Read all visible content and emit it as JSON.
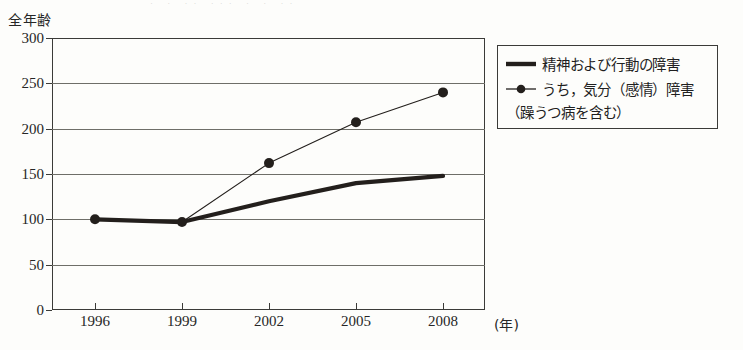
{
  "page": {
    "unit_label": "全年齢",
    "scan_remnant": "· ·  ·· ··· ·  ·  ··"
  },
  "chart_data": {
    "type": "line",
    "title": "",
    "subtitle": "",
    "unit_caption": "全年齢",
    "xlabel": "(年)",
    "ylabel": "",
    "categories": [
      "1996",
      "1999",
      "2002",
      "2005",
      "2008"
    ],
    "x": [
      1996,
      1999,
      2002,
      2005,
      2008
    ],
    "xtick_labels": [
      "1996",
      "1999",
      "2002",
      "2005",
      "2008"
    ],
    "ytick_labels": [
      "0",
      "50",
      "100",
      "150",
      "200",
      "250",
      "300"
    ],
    "yticks": [
      0,
      50,
      100,
      150,
      200,
      250,
      300
    ],
    "ylim": [
      0,
      300
    ],
    "xlim": [
      1995,
      2009.5
    ],
    "grid": true,
    "grid_axis": "y",
    "legend_position": "right-outside",
    "series": [
      {
        "name": "精神および行動の障害",
        "values": [
          100,
          97,
          120,
          140,
          148
        ],
        "style": "thick-line",
        "marker": "none",
        "color": "#231f1c",
        "line_width": 4.2
      },
      {
        "name": "うち，気分（感情）障害（躁うつ病を含む）",
        "name_line1": "うち，気分（感情）障害",
        "name_line2": "（躁うつ病を含む）",
        "values": [
          100,
          97,
          162,
          207,
          240
        ],
        "style": "thin-line-with-markers",
        "marker": "circle",
        "color": "#231f1c",
        "line_width": 1.1,
        "marker_size": 5
      }
    ]
  },
  "legend": {
    "items": [
      {
        "label": "精神および行動の障害",
        "sample": "thick-line-sample"
      },
      {
        "label": "うち，気分（感情）障害",
        "sample": "line-circle-sample"
      }
    ],
    "continuation_line": "（躁うつ病を含む）"
  }
}
